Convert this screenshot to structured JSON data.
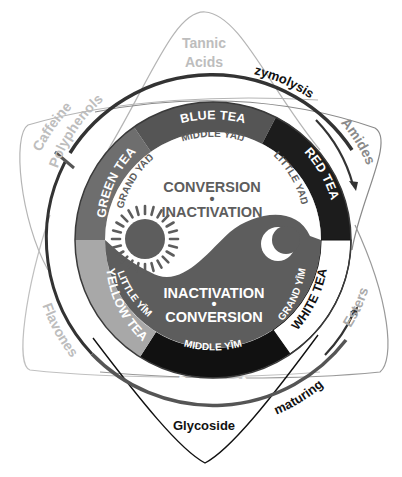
{
  "diagram": {
    "colors": {
      "background": "#ffffff",
      "blue_tea": "#555555",
      "green_tea": "#6e6e6e",
      "yellow_tea": "#a8a8a8",
      "black_tea": "#111111",
      "red_tea": "#1c1c1c",
      "white_tea": "#ffffff",
      "yin": "#5d5d5d",
      "yang": "#ffffff",
      "compound_text": "#bdbdbd",
      "outer_arc": "#333333"
    },
    "tea_segments": [
      {
        "label": "BLUE TEA",
        "text_color": "#ffffff",
        "fill": "#555555"
      },
      {
        "label": "RED TEA",
        "text_color": "#ffffff",
        "fill": "#1c1c1c"
      },
      {
        "label": "WHITE TEA",
        "text_color": "#111111",
        "fill": "#ffffff"
      },
      {
        "label": "BLACK TEA",
        "text_color": "#ffffff",
        "fill": "#111111"
      },
      {
        "label": "YELLOW TEA",
        "text_color": "#ffffff",
        "fill": "#a8a8a8"
      },
      {
        "label": "GREEN TEA",
        "text_color": "#ffffff",
        "fill": "#6e6e6e"
      }
    ],
    "inner_labels": {
      "middle_yan": "MIDDLE YAŊ",
      "little_yan": "LITTLE YAŊ",
      "grand_yan": "GRAND YAŊ",
      "grand_yim": "GRAND YĪM",
      "middle_yim": "MIDDLE YĪM",
      "little_yim": "LITTLE YĪM"
    },
    "center": {
      "top_line1": "CONVERSION",
      "top_dot": "•",
      "top_line2": "INACTIVATION",
      "bottom_line1": "INACTIVATION",
      "bottom_dot": "•",
      "bottom_line2": "CONVERSION"
    },
    "symbols": {
      "sun": "sun-icon",
      "moon": "crescent-moon-icon"
    },
    "compounds": {
      "tannic_line1": "Tannic",
      "tannic_line2": "Acids",
      "caffeine": "Caffeine",
      "polyphenols": "Polyphenols",
      "amides": "Amides",
      "flavones": "Flavones",
      "esters": "Esters",
      "glycoside": "Glycoside"
    },
    "processes": {
      "zymolysis": "zymolysis",
      "maturing": "maturing"
    }
  }
}
